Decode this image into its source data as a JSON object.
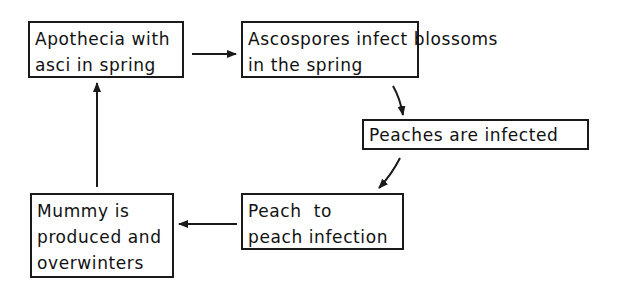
{
  "diagram": {
    "title": "",
    "nodes": [
      {
        "id": "apothecia",
        "lines": [
          "Apothecia with",
          "asci in spring"
        ]
      },
      {
        "id": "ascospores",
        "lines": [
          "Ascospores infect blossoms",
          "in the spring"
        ]
      },
      {
        "id": "peaches-infected",
        "lines": [
          "Peaches are infected"
        ]
      },
      {
        "id": "peach-to-peach",
        "lines": [
          "Peach  to",
          "peach infection"
        ]
      },
      {
        "id": "mummy",
        "lines": [
          "Mummy is",
          "produced and",
          "overwinters"
        ]
      }
    ],
    "edges": [
      {
        "from": "apothecia",
        "to": "ascospores"
      },
      {
        "from": "ascospores",
        "to": "peaches-infected"
      },
      {
        "from": "peaches-infected",
        "to": "peach-to-peach"
      },
      {
        "from": "peach-to-peach",
        "to": "mummy"
      },
      {
        "from": "mummy",
        "to": "apothecia"
      }
    ],
    "colors": {
      "stroke": "#1a1a1a",
      "background": "#ffffff"
    }
  }
}
